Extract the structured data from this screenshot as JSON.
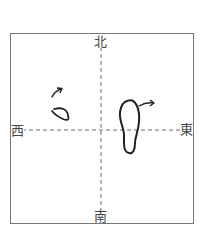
{
  "labels": {
    "north": "北",
    "south": "南",
    "east": "東",
    "west": "西"
  },
  "colors": {
    "frame": "#777777",
    "axis": "#666666",
    "stroke": "#222222"
  },
  "figures": [
    {
      "name": "small-loop-with-arrow",
      "position": "upper-left quadrant",
      "arrow_direction": "up-right"
    },
    {
      "name": "footprint-with-arrow",
      "position": "right of center, straddling east-west axis",
      "arrow_direction": "east"
    }
  ]
}
